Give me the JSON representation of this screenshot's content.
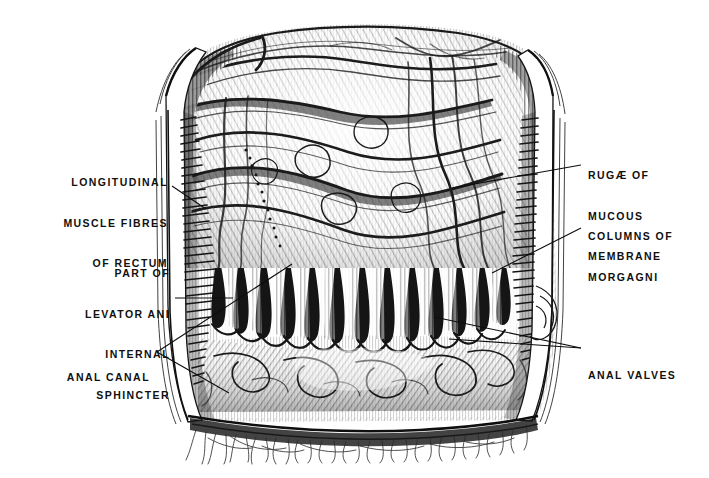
{
  "figure": {
    "kind": "anatomical-engraving",
    "background_color": "#ffffff",
    "ink_color": "#101010",
    "width": 709,
    "height": 478
  },
  "labels": [
    {
      "id": "longitudinal-muscle-fibres-of-rectum",
      "lines": [
        "LONGITUDINAL",
        "MUSCLE FIBRES",
        "OF RECTUM"
      ],
      "side": "left",
      "align": "right",
      "x": 28,
      "y": 149,
      "width": 140,
      "leader": {
        "type": "line",
        "points": [
          [
            172,
            186
          ],
          [
            205,
            208
          ]
        ]
      }
    },
    {
      "id": "part-of-levator-ani-internal-sphincter",
      "lines": [
        "PART OF",
        "LEVATOR ANI",
        "INTERNAL",
        "SPHINCTER"
      ],
      "side": "left",
      "align": "right",
      "x": 58,
      "y": 240,
      "width": 112,
      "leader": {
        "type": "line",
        "points": [
          [
            175,
            298
          ],
          [
            232,
            298
          ]
        ]
      }
    },
    {
      "id": "anal-canal",
      "lines": [
        "ANAL CANAL"
      ],
      "side": "left",
      "align": "right",
      "x": 38,
      "y": 344,
      "width": 112,
      "leader": {
        "type": "bracket",
        "apex": [
          156,
          352
        ],
        "points": [
          [
            156,
            352
          ],
          [
            290,
            265
          ],
          [
            156,
            352
          ],
          [
            228,
            392
          ]
        ]
      }
    },
    {
      "id": "rugae-of-mucous-membrane",
      "lines": [
        "RUGÆ OF",
        "MUCOUS",
        "MEMBRANE"
      ],
      "side": "right",
      "align": "left",
      "x": 588,
      "y": 142,
      "width": 120,
      "leader": {
        "type": "line",
        "points": [
          [
            582,
            165
          ],
          [
            452,
            188
          ]
        ]
      }
    },
    {
      "id": "columns-of-morgagni",
      "lines": [
        "COLUMNS OF",
        "MORGAGNI"
      ],
      "side": "right",
      "align": "left",
      "x": 588,
      "y": 203,
      "width": 120,
      "leader": {
        "type": "line",
        "points": [
          [
            582,
            227
          ],
          [
            492,
            272
          ]
        ]
      }
    },
    {
      "id": "anal-valves",
      "lines": [
        "ANAL VALVES"
      ],
      "side": "right",
      "align": "left",
      "x": 588,
      "y": 342,
      "width": 120,
      "leader": {
        "type": "fork",
        "points": [
          [
            582,
            348
          ],
          [
            434,
            317
          ],
          [
            582,
            348
          ],
          [
            448,
            338
          ]
        ]
      }
    }
  ],
  "structures": {
    "rectal_ampulla": "Upper chamber showing rugae of mucous membrane (transverse and oblique folds)",
    "anal_columns_count": 13,
    "anal_columns_note": "Vertical dark ridges with rounded lower tips (columns of Morgagni)",
    "muscle_band_note": "Hatched striped band along both lateral walls = longitudinal muscle fibres / levator ani",
    "perianal_hairs": "Fine radiating strokes along the lower border"
  }
}
